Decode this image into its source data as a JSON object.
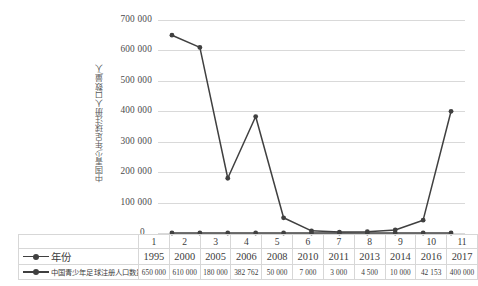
{
  "chart_data": {
    "type": "line",
    "title": "",
    "xlabel": "",
    "ylabel": "中国青少年足球注册人口数量/人",
    "ylim": [
      0,
      700000
    ],
    "yticks": [
      0,
      100000,
      200000,
      300000,
      400000,
      500000,
      600000,
      700000
    ],
    "ytick_labels": [
      "0",
      "100 000",
      "200 000",
      "300 000",
      "400 000",
      "500 000",
      "600 000",
      "700 000"
    ],
    "grid": true,
    "legend_position": "bottom-table",
    "categories": [
      "1",
      "2",
      "3",
      "4",
      "5",
      "6",
      "7",
      "8",
      "9",
      "10",
      "11"
    ],
    "series": [
      {
        "name": "年份",
        "values": [
          1995,
          2000,
          2005,
          2006,
          2008,
          2010,
          2011,
          2013,
          2014,
          2016,
          2017
        ],
        "plotted_values": [
          0,
          0,
          0,
          0,
          0,
          0,
          0,
          0,
          0,
          0,
          0
        ],
        "display_values": [
          "1995",
          "2000",
          "2005",
          "2006",
          "2008",
          "2010",
          "2011",
          "2013",
          "2014",
          "2016",
          "2017"
        ],
        "color": "#404040"
      },
      {
        "name": "中国青少年足球注册人口数量/人",
        "values": [
          650000,
          610000,
          180000,
          382762,
          50000,
          7000,
          3000,
          4500,
          10000,
          42153,
          400000
        ],
        "display_values": [
          "650 000",
          "610 000",
          "180 000",
          "382 762",
          "50 000",
          "7 000",
          "3 000",
          "4 500",
          "10 000",
          "42 153",
          "400 000"
        ],
        "color": "#404040"
      }
    ]
  },
  "axis": {
    "y_title": "中国青少年足球注册人口数量/人",
    "zero_label": "0"
  },
  "table": {
    "index_header_blank": "",
    "legend_rows": [
      {
        "label": "年份"
      },
      {
        "label": "中国青少年足球注册人口数量/人"
      }
    ]
  }
}
